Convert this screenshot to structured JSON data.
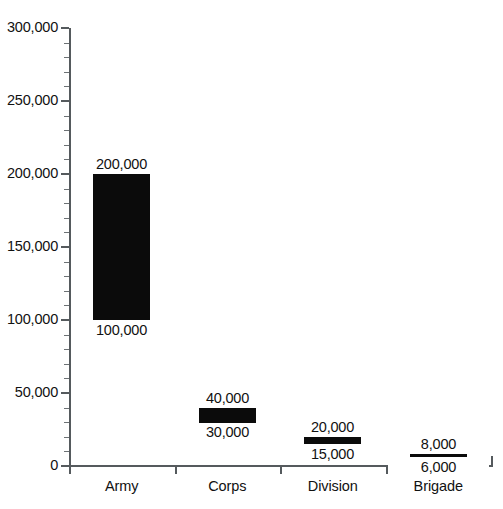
{
  "chart_data": {
    "type": "bar",
    "subtype": "floating-range-bar",
    "title": "",
    "xlabel": "",
    "ylabel": "",
    "categories": [
      "Army",
      "Corps",
      "Division",
      "Brigade"
    ],
    "ylim": [
      0,
      300000
    ],
    "y_major_step": 50000,
    "y_minor_per_major": 5,
    "grid": false,
    "legend": null,
    "y_tick_labels": [
      "300,000",
      "250,000",
      "200,000",
      "150,000",
      "100,000",
      "50,000",
      "0"
    ],
    "y_tick_values": [
      300000,
      250000,
      200000,
      150000,
      100000,
      50000,
      0
    ],
    "series": [
      {
        "name": "Personnel strength range",
        "ranges": [
          {
            "category": "Army",
            "low": 100000,
            "high": 200000,
            "low_label": "100,000",
            "high_label": "200,000"
          },
          {
            "category": "Corps",
            "low": 30000,
            "high": 40000,
            "low_label": "30,000",
            "high_label": "40,000"
          },
          {
            "category": "Division",
            "low": 15000,
            "high": 20000,
            "low_label": "15,000",
            "high_label": "20,000"
          },
          {
            "category": "Brigade",
            "low": 6000,
            "high": 8000,
            "low_label": "6,000",
            "high_label": "8,000"
          }
        ]
      }
    ],
    "bar_color": "#0b0b0b",
    "axis_color": "#555a5d"
  }
}
